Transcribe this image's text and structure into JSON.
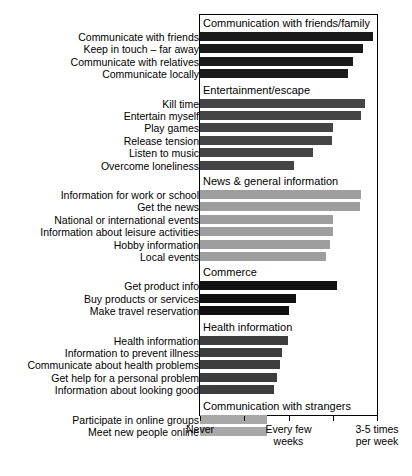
{
  "chart_data": {
    "type": "bar",
    "orientation": "horizontal",
    "title": "",
    "xlabel": "",
    "ylabel": "",
    "grid": false,
    "legend": "none",
    "xlim": [
      0,
      4
    ],
    "axis": {
      "ticks": [
        0,
        1,
        2,
        3,
        4
      ],
      "tick_labels": [
        "Never",
        "",
        "Every few\nweeks",
        "",
        "3-5 times\nper week"
      ],
      "labeled_ticks": [
        {
          "value": 0,
          "label_line1": "Never",
          "label_line2": ""
        },
        {
          "value": 2,
          "label_line1": "Every few",
          "label_line2": "weeks"
        },
        {
          "value": 4,
          "label_line1": "3-5 times",
          "label_line2": "per week"
        }
      ]
    },
    "groups": [
      {
        "name": "Communication with friends/family",
        "color": "#1a1a1a",
        "categories": [
          "Communicate with friends",
          "Keep in touch – far away",
          "Communicate with relatives",
          "Communicate locally"
        ],
        "values": [
          3.91,
          3.68,
          3.45,
          3.34
        ]
      },
      {
        "name": "Entertainment/escape",
        "color": "#454545",
        "categories": [
          "Kill time",
          "Entertain myself",
          "Play games",
          "Release tension",
          "Listen to music",
          "Overcome loneliness"
        ],
        "values": [
          3.73,
          3.64,
          3.0,
          2.98,
          2.55,
          2.12
        ]
      },
      {
        "name": "News & general information",
        "color": "#9e9e9e",
        "categories": [
          "Information for work or school",
          "Get the news",
          "National or international events",
          "Information about leisure activities",
          "Hobby information",
          "Local events"
        ],
        "values": [
          3.64,
          3.61,
          3.0,
          3.0,
          2.93,
          2.84
        ]
      },
      {
        "name": "Commerce",
        "color": "#111111",
        "categories": [
          "Get product info",
          "Buy products or services",
          "Make travel reservation"
        ],
        "values": [
          3.09,
          2.18,
          2.0
        ]
      },
      {
        "name": "Health information",
        "color": "#3d3d3d",
        "categories": [
          "Health information",
          "Information to prevent illness",
          "Communicate about health problems",
          "Get help for a personal problem",
          "Information about looking good"
        ],
        "values": [
          1.98,
          1.86,
          1.8,
          1.75,
          1.68
        ]
      },
      {
        "name": "Communication with strangers",
        "color": "#a8a8a8",
        "categories": [
          "Participate in online groups",
          "Meet new people online"
        ],
        "values": [
          1.52,
          1.52
        ]
      }
    ]
  }
}
